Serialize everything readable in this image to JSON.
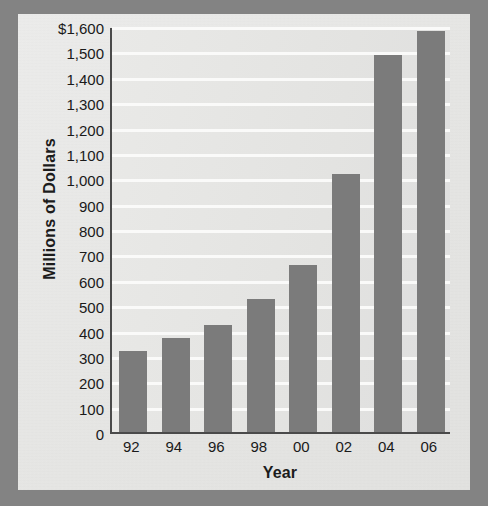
{
  "chart_data": {
    "type": "bar",
    "title": "",
    "xlabel": "Year",
    "ylabel": "Millions of Dollars",
    "categories": [
      "92",
      "94",
      "96",
      "98",
      "00",
      "02",
      "04",
      "06"
    ],
    "values": [
      320,
      370,
      420,
      525,
      660,
      1015,
      1485,
      1580
    ],
    "ylim": [
      0,
      1600
    ],
    "ytick_values": [
      0,
      100,
      200,
      300,
      400,
      500,
      600,
      700,
      800,
      900,
      1000,
      1100,
      1200,
      1300,
      1400,
      1500,
      1600
    ],
    "ytick_labels": [
      "0",
      "100",
      "200",
      "300",
      "400",
      "500",
      "600",
      "700",
      "800",
      "900",
      "1,000",
      "1,100",
      "1,200",
      "1,300",
      "1,400",
      "1,500",
      "$1,600"
    ],
    "grid": true,
    "gridline_color": "#fbfbfa",
    "legend": null,
    "series": [
      {
        "name": "Millions of Dollars",
        "values": [
          320,
          370,
          420,
          525,
          660,
          1015,
          1485,
          1580
        ]
      }
    ],
    "colors": {
      "bar": "#7b7b7b",
      "axis": "#4a4a4a",
      "plot_background": "#e4e4e2",
      "panel_background": "#e9e9e7",
      "frame": "#838383",
      "text": "#1a1a1a"
    }
  }
}
